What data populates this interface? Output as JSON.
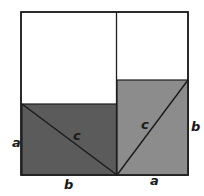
{
  "diagram": {
    "type": "pythagorean-proof",
    "colors": {
      "background": "#ffffff",
      "stroke": "#1e1e1e",
      "dark_fill": "#5b5b5b",
      "medium_fill": "#8c8c8c",
      "white_fill": "#ffffff"
    },
    "labels": {
      "left_side": "a",
      "left_hypotenuse": "c",
      "left_bottom": "b",
      "right_hypotenuse": "c",
      "right_side": "b",
      "right_bottom": "a"
    }
  }
}
